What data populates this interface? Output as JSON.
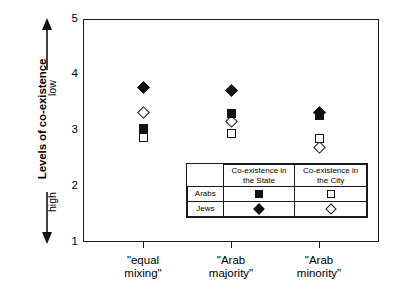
{
  "chart_data": {
    "type": "scatter",
    "title": "",
    "ylabel": "Levels of co-existence",
    "xlabel": "",
    "ylim": [
      1,
      5
    ],
    "yticks": [
      1,
      2,
      3,
      4,
      5
    ],
    "ytick_labels": [
      "1",
      "2",
      "3",
      "4",
      "5"
    ],
    "y_minor_ticks": [
      1.5,
      2.5,
      3.5,
      4.5
    ],
    "grid": false,
    "axis_direction_labels": {
      "top": "low",
      "bottom": "high"
    },
    "categories": [
      "\"equal mixing\"",
      "\"Arab majority\"",
      "\"Arab minority\""
    ],
    "legend_position": "inside-lower-right",
    "series": [
      {
        "name": "Jews — Co-existence in the State",
        "marker": "diamond-filled",
        "values": [
          3.77,
          3.72,
          3.33
        ]
      },
      {
        "name": "Jews — Co-existence in the City",
        "marker": "diamond-open",
        "values": [
          3.32,
          3.17,
          2.7
        ]
      },
      {
        "name": "Arabs — Co-existence in the State",
        "marker": "square-filled",
        "values": [
          3.04,
          3.3,
          3.27
        ]
      },
      {
        "name": "Arabs — Co-existence in the City",
        "marker": "square-open",
        "values": [
          2.87,
          2.95,
          2.85
        ]
      }
    ]
  },
  "axis": {
    "y_title": "Levels of co-existence",
    "direction_low": "low",
    "direction_high": "high",
    "y_labels": [
      "5",
      "4",
      "3",
      "2",
      "1"
    ],
    "x_labels": [
      {
        "line1": "\"equal",
        "line2": "mixing\""
      },
      {
        "line1": "\"Arab",
        "line2": "majority\""
      },
      {
        "line1": "\"Arab",
        "line2": "minority\""
      }
    ]
  },
  "legend": {
    "corner": "",
    "col_headers": [
      {
        "line1": "Co-existence in",
        "line2": "the State"
      },
      {
        "line1": "Co-existence in",
        "line2": "the City"
      }
    ],
    "rows": [
      {
        "label": "Arabs",
        "state_marker": "square-filled",
        "city_marker": "square-open"
      },
      {
        "label": "Jews",
        "state_marker": "diamond-filled",
        "city_marker": "diamond-open"
      }
    ]
  }
}
